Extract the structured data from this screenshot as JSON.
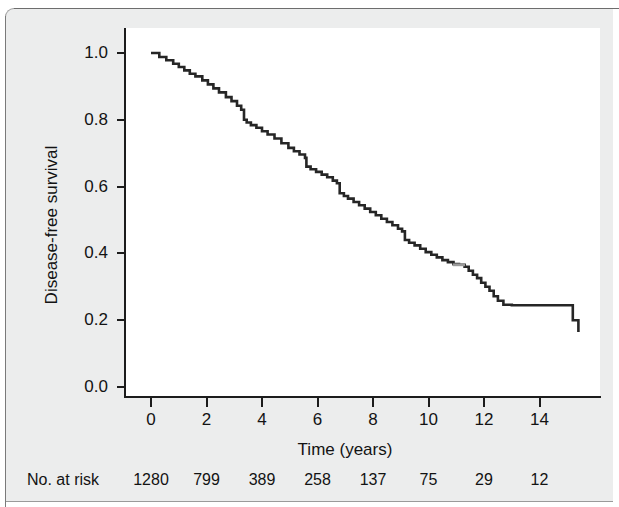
{
  "figure": {
    "panel_background": "#eceded",
    "plot_background": "#ffffff",
    "axis_color": "#1c1c1c",
    "curve_color": "#262626",
    "censor_mark_color": "#9b9b9b"
  },
  "chart_data": {
    "type": "line",
    "subtype": "kaplan-meier-step",
    "title": "",
    "xlabel": "Time (years)",
    "ylabel": "Disease-free survival",
    "xlim": [
      0,
      15.5
    ],
    "ylim": [
      0.0,
      1.0
    ],
    "grid": false,
    "legend": null,
    "xticks": [
      0,
      2,
      4,
      6,
      8,
      10,
      12,
      14
    ],
    "xtick_labels": [
      "0",
      "2",
      "4",
      "6",
      "8",
      "10",
      "12",
      "14"
    ],
    "yticks": [
      0.0,
      0.2,
      0.4,
      0.6,
      0.8,
      1.0
    ],
    "ytick_labels": [
      "0.0",
      "0.2",
      "0.4",
      "0.6",
      "0.8",
      "1.0"
    ],
    "series": [
      {
        "name": "Disease-free survival",
        "color": "#262626",
        "x": [
          0.0,
          0.3,
          0.55,
          0.8,
          1.0,
          1.2,
          1.4,
          1.6,
          1.85,
          2.05,
          2.25,
          2.45,
          2.7,
          2.9,
          3.1,
          3.25,
          3.35,
          3.45,
          3.6,
          3.8,
          4.0,
          4.2,
          4.45,
          4.7,
          4.95,
          5.15,
          5.35,
          5.55,
          5.6,
          5.75,
          5.95,
          6.15,
          6.35,
          6.55,
          6.7,
          6.8,
          6.95,
          7.1,
          7.3,
          7.5,
          7.7,
          7.9,
          8.1,
          8.3,
          8.5,
          8.7,
          8.9,
          9.05,
          9.15,
          9.3,
          9.5,
          9.7,
          9.9,
          10.1,
          10.3,
          10.5,
          10.7,
          10.9,
          11.1,
          11.3,
          11.45,
          11.6,
          11.75,
          11.9,
          12.05,
          12.2,
          12.35,
          12.5,
          12.7,
          13.0,
          13.5,
          14.0,
          14.5,
          15.0,
          15.2,
          15.4
        ],
        "y": [
          1.0,
          0.988,
          0.978,
          0.968,
          0.958,
          0.948,
          0.938,
          0.93,
          0.918,
          0.906,
          0.894,
          0.882,
          0.868,
          0.856,
          0.842,
          0.83,
          0.8,
          0.792,
          0.784,
          0.776,
          0.766,
          0.756,
          0.744,
          0.73,
          0.716,
          0.706,
          0.696,
          0.686,
          0.66,
          0.652,
          0.644,
          0.636,
          0.628,
          0.618,
          0.61,
          0.58,
          0.572,
          0.564,
          0.554,
          0.544,
          0.534,
          0.524,
          0.514,
          0.504,
          0.494,
          0.484,
          0.474,
          0.466,
          0.44,
          0.432,
          0.424,
          0.414,
          0.404,
          0.396,
          0.388,
          0.38,
          0.374,
          0.368,
          0.366,
          0.36,
          0.348,
          0.336,
          0.326,
          0.312,
          0.3,
          0.288,
          0.272,
          0.258,
          0.246,
          0.245,
          0.245,
          0.245,
          0.245,
          0.245,
          0.2,
          0.165
        ]
      }
    ],
    "censored_marks": [
      {
        "x": 11.1,
        "y": 0.366,
        "color": "#9b9b9b"
      }
    ],
    "risk_table": {
      "label": "No. at risk",
      "times": [
        0,
        2,
        4,
        6,
        8,
        10,
        12,
        14
      ],
      "counts": [
        "1280",
        "799",
        "389",
        "258",
        "137",
        "75",
        "29",
        "12"
      ]
    }
  }
}
